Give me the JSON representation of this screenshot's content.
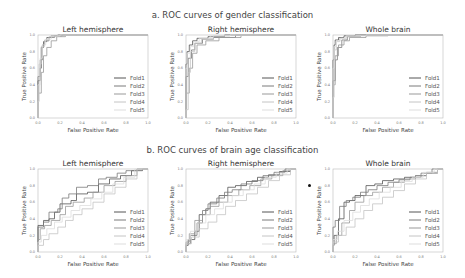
{
  "sections": [
    {
      "title": "a. ROC curves of gender classification"
    },
    {
      "title": "b. ROC curves of brain age classification"
    }
  ],
  "colors": {
    "Fold1": "#555555",
    "Fold2": "#7a7a7a",
    "Fold3": "#999999",
    "Fold4": "#c4c4c4",
    "Fold5": "#dddddd",
    "frame": "#bbbbbb",
    "diagonal": "#cccccc"
  },
  "chart_data": [
    {
      "type": "line",
      "group": "a. ROC curves of gender classification",
      "title": "Left hemisphere",
      "xlabel": "False Positive Rate",
      "ylabel": "True Positive Rate",
      "xlim": [
        0,
        1
      ],
      "ylim": [
        0,
        1
      ],
      "xticks": [
        "0.0",
        "0.2",
        "0.4",
        "0.6",
        "0.8",
        "1.0"
      ],
      "yticks": [
        "0.0",
        "0.2",
        "0.4",
        "0.6",
        "0.8",
        "1.0"
      ],
      "legend": [
        "Fold1",
        "Fold2",
        "Fold3",
        "Fold4",
        "Fold5"
      ],
      "legend_position": "lower right",
      "grid": false,
      "series": [
        {
          "name": "Fold1",
          "x": [
            0,
            0.02,
            0.03,
            0.05,
            0.08,
            0.12,
            0.18,
            0.25,
            0.4,
            1
          ],
          "y": [
            0,
            0.45,
            0.6,
            0.85,
            0.92,
            0.97,
            0.99,
            1,
            1,
            1
          ]
        },
        {
          "name": "Fold2",
          "x": [
            0,
            0.02,
            0.04,
            0.06,
            0.1,
            0.15,
            0.22,
            0.35,
            1
          ],
          "y": [
            0,
            0.5,
            0.7,
            0.88,
            0.93,
            0.97,
            0.99,
            1,
            1
          ]
        },
        {
          "name": "Fold3",
          "x": [
            0,
            0.03,
            0.05,
            0.08,
            0.12,
            0.17,
            0.25,
            0.4,
            1
          ],
          "y": [
            0,
            0.3,
            0.55,
            0.75,
            0.85,
            0.93,
            0.98,
            1,
            1
          ]
        },
        {
          "name": "Fold4",
          "x": [
            0,
            0.01,
            0.03,
            0.06,
            0.1,
            0.18,
            0.3,
            1
          ],
          "y": [
            0,
            0.2,
            0.65,
            0.86,
            0.94,
            0.98,
            1,
            1
          ]
        },
        {
          "name": "Fold5",
          "x": [
            0,
            0.02,
            0.04,
            0.07,
            0.12,
            0.2,
            0.35,
            1
          ],
          "y": [
            0,
            0.4,
            0.72,
            0.88,
            0.95,
            0.99,
            1,
            1
          ]
        }
      ]
    },
    {
      "type": "line",
      "group": "a. ROC curves of gender classification",
      "title": "Right hemisphere",
      "xlabel": "False Positive Rate",
      "ylabel": "True Positive Rate",
      "xlim": [
        0,
        1
      ],
      "ylim": [
        0,
        1
      ],
      "xticks": [
        "0.0",
        "0.2",
        "0.4",
        "0.6",
        "0.8",
        "1.0"
      ],
      "yticks": [
        "0.0",
        "0.2",
        "0.4",
        "0.6",
        "0.8",
        "1.0"
      ],
      "legend": [
        "Fold1",
        "Fold2",
        "Fold3",
        "Fold4",
        "Fold5"
      ],
      "legend_position": "lower right",
      "grid": false,
      "series": [
        {
          "name": "Fold1",
          "x": [
            0,
            0.01,
            0.03,
            0.06,
            0.1,
            0.2,
            0.35,
            0.6,
            1
          ],
          "y": [
            0,
            0.65,
            0.8,
            0.88,
            0.93,
            0.96,
            0.98,
            1,
            1
          ]
        },
        {
          "name": "Fold2",
          "x": [
            0,
            0.02,
            0.05,
            0.08,
            0.15,
            0.25,
            0.45,
            0.7,
            1
          ],
          "y": [
            0,
            0.5,
            0.72,
            0.82,
            0.9,
            0.95,
            0.97,
            1,
            1
          ]
        },
        {
          "name": "Fold3",
          "x": [
            0,
            0.03,
            0.06,
            0.1,
            0.18,
            0.3,
            0.5,
            0.8,
            1
          ],
          "y": [
            0,
            0.3,
            0.6,
            0.78,
            0.88,
            0.93,
            0.97,
            1,
            1
          ]
        },
        {
          "name": "Fold4",
          "x": [
            0,
            0.02,
            0.04,
            0.08,
            0.14,
            0.25,
            0.4,
            1
          ],
          "y": [
            0,
            0.1,
            0.55,
            0.8,
            0.9,
            0.95,
            0.99,
            1
          ]
        },
        {
          "name": "Fold5",
          "x": [
            0,
            0.01,
            0.04,
            0.07,
            0.12,
            0.22,
            0.4,
            1
          ],
          "y": [
            0,
            0.6,
            0.78,
            0.86,
            0.92,
            0.96,
            0.99,
            1
          ]
        }
      ]
    },
    {
      "type": "line",
      "group": "a. ROC curves of gender classification",
      "title": "Whole brain",
      "xlabel": "False Positive Rate",
      "ylabel": "True Positive Rate",
      "xlim": [
        0,
        1
      ],
      "ylim": [
        0,
        1
      ],
      "xticks": [
        "0.0",
        "0.2",
        "0.4",
        "0.6",
        "0.8",
        "1.0"
      ],
      "yticks": [
        "0.0",
        "0.2",
        "0.4",
        "0.6",
        "0.8",
        "1.0"
      ],
      "legend": [
        "Fold1",
        "Fold2",
        "Fold3",
        "Fold4",
        "Fold5"
      ],
      "legend_position": "lower right",
      "grid": false,
      "series": [
        {
          "name": "Fold1",
          "x": [
            0,
            0.01,
            0.02,
            0.05,
            0.1,
            0.2,
            0.4,
            1
          ],
          "y": [
            0,
            0.7,
            0.88,
            0.94,
            0.97,
            0.99,
            1,
            1
          ]
        },
        {
          "name": "Fold2",
          "x": [
            0,
            0.02,
            0.04,
            0.08,
            0.13,
            0.25,
            0.45,
            1
          ],
          "y": [
            0,
            0.45,
            0.7,
            0.85,
            0.94,
            0.98,
            1,
            1
          ]
        },
        {
          "name": "Fold3",
          "x": [
            0,
            0.02,
            0.05,
            0.1,
            0.15,
            0.3,
            0.5,
            1
          ],
          "y": [
            0,
            0.4,
            0.75,
            0.88,
            0.93,
            0.97,
            0.99,
            1
          ]
        },
        {
          "name": "Fold4",
          "x": [
            0,
            0.01,
            0.03,
            0.06,
            0.12,
            0.25,
            0.45,
            1
          ],
          "y": [
            0,
            0.25,
            0.82,
            0.92,
            0.96,
            0.98,
            1,
            1
          ]
        },
        {
          "name": "Fold5",
          "x": [
            0,
            0.01,
            0.03,
            0.07,
            0.12,
            0.3,
            0.6,
            1
          ],
          "y": [
            0,
            0.6,
            0.86,
            0.93,
            0.96,
            0.99,
            1,
            1
          ]
        }
      ]
    },
    {
      "type": "line",
      "group": "b. ROC curves of brain age classification",
      "title": "Left hemisphere",
      "xlabel": "False Positive Rate",
      "ylabel": "True Positive Rate",
      "xlim": [
        0,
        1
      ],
      "ylim": [
        0,
        1
      ],
      "xticks": [
        "0.0",
        "0.2",
        "0.4",
        "0.6",
        "0.8",
        "1.0"
      ],
      "yticks": [
        "0.0",
        "0.2",
        "0.4",
        "0.6",
        "0.8",
        "1.0"
      ],
      "legend": [
        "Fold1",
        "Fold2",
        "Fold3",
        "Fold4",
        "Fold5"
      ],
      "legend_position": "lower right",
      "grid": false,
      "series": [
        {
          "name": "Fold1",
          "x": [
            0,
            0,
            0.05,
            0.1,
            0.15,
            0.2,
            0.3,
            0.35,
            0.45,
            0.55,
            0.65,
            0.75,
            0.85,
            0.95,
            1
          ],
          "y": [
            0,
            0.25,
            0.32,
            0.38,
            0.4,
            0.48,
            0.58,
            0.62,
            0.7,
            0.72,
            0.82,
            0.88,
            0.92,
            0.98,
            1
          ]
        },
        {
          "name": "Fold2",
          "x": [
            0,
            0,
            0.05,
            0.1,
            0.18,
            0.22,
            0.28,
            0.35,
            0.45,
            0.55,
            0.62,
            0.72,
            0.8,
            0.9,
            1
          ],
          "y": [
            0,
            0.28,
            0.3,
            0.36,
            0.48,
            0.52,
            0.65,
            0.7,
            0.78,
            0.8,
            0.88,
            0.9,
            0.95,
            0.98,
            1
          ]
        },
        {
          "name": "Fold3",
          "x": [
            0,
            0.02,
            0.06,
            0.12,
            0.2,
            0.25,
            0.32,
            0.42,
            0.5,
            0.6,
            0.7,
            0.8,
            0.9,
            1
          ],
          "y": [
            0,
            0.15,
            0.28,
            0.32,
            0.38,
            0.45,
            0.55,
            0.6,
            0.65,
            0.72,
            0.8,
            0.85,
            0.92,
            1
          ]
        },
        {
          "name": "Fold4",
          "x": [
            0,
            0.05,
            0.1,
            0.18,
            0.25,
            0.32,
            0.4,
            0.5,
            0.6,
            0.7,
            0.8,
            0.9,
            1
          ],
          "y": [
            0,
            0.08,
            0.15,
            0.22,
            0.3,
            0.38,
            0.45,
            0.52,
            0.6,
            0.7,
            0.78,
            0.88,
            1
          ]
        },
        {
          "name": "Fold5",
          "x": [
            0,
            0.03,
            0.08,
            0.15,
            0.22,
            0.3,
            0.38,
            0.48,
            0.58,
            0.68,
            0.78,
            0.88,
            1
          ],
          "y": [
            0,
            0.12,
            0.2,
            0.28,
            0.36,
            0.42,
            0.5,
            0.56,
            0.64,
            0.72,
            0.82,
            0.9,
            1
          ]
        }
      ]
    },
    {
      "type": "line",
      "group": "b. ROC curves of brain age classification",
      "title": "Right hemisphere",
      "xlabel": "False Positive Rate",
      "ylabel": "True Positive Rate",
      "xlim": [
        0,
        1
      ],
      "ylim": [
        0,
        1
      ],
      "xticks": [
        "0.0",
        "0.2",
        "0.4",
        "0.6",
        "0.8",
        "1.0"
      ],
      "yticks": [
        "0.0",
        "0.2",
        "0.4",
        "0.6",
        "0.8",
        "1.0"
      ],
      "legend": [
        "Fold1",
        "Fold2",
        "Fold3",
        "Fold4",
        "Fold5"
      ],
      "legend_position": "lower right",
      "grid": false,
      "series": [
        {
          "name": "Fold1",
          "x": [
            0,
            0.02,
            0.08,
            0.12,
            0.18,
            0.22,
            0.3,
            0.38,
            0.45,
            0.55,
            0.65,
            0.75,
            0.85,
            0.95,
            1
          ],
          "y": [
            0,
            0.08,
            0.15,
            0.25,
            0.45,
            0.52,
            0.6,
            0.68,
            0.78,
            0.8,
            0.85,
            0.9,
            0.93,
            0.97,
            1
          ]
        },
        {
          "name": "Fold2",
          "x": [
            0,
            0.04,
            0.1,
            0.15,
            0.2,
            0.28,
            0.35,
            0.42,
            0.5,
            0.6,
            0.7,
            0.8,
            0.9,
            1
          ],
          "y": [
            0,
            0.1,
            0.2,
            0.35,
            0.5,
            0.58,
            0.65,
            0.72,
            0.75,
            0.82,
            0.86,
            0.92,
            0.96,
            1
          ]
        },
        {
          "name": "Fold3",
          "x": [
            0,
            0.03,
            0.08,
            0.15,
            0.22,
            0.3,
            0.38,
            0.48,
            0.58,
            0.68,
            0.78,
            0.88,
            0.95,
            1
          ],
          "y": [
            0,
            0.12,
            0.22,
            0.38,
            0.45,
            0.55,
            0.6,
            0.68,
            0.75,
            0.8,
            0.88,
            0.92,
            0.98,
            1
          ]
        },
        {
          "name": "Fold4",
          "x": [
            0,
            0.05,
            0.12,
            0.2,
            0.28,
            0.36,
            0.45,
            0.55,
            0.65,
            0.75,
            0.85,
            0.95,
            1
          ],
          "y": [
            0,
            0.1,
            0.18,
            0.28,
            0.36,
            0.45,
            0.55,
            0.62,
            0.7,
            0.78,
            0.86,
            0.93,
            1
          ]
        },
        {
          "name": "Fold5",
          "x": [
            0,
            0.04,
            0.1,
            0.18,
            0.26,
            0.34,
            0.42,
            0.52,
            0.62,
            0.72,
            0.82,
            0.92,
            1
          ],
          "y": [
            0,
            0.15,
            0.25,
            0.35,
            0.45,
            0.52,
            0.6,
            0.68,
            0.75,
            0.82,
            0.9,
            0.95,
            1
          ]
        }
      ]
    },
    {
      "type": "line",
      "group": "b. ROC curves of brain age classification",
      "title": "Whole brain",
      "xlabel": "False Positive Rate",
      "ylabel": "True Positive Rate",
      "xlim": [
        0,
        1
      ],
      "ylim": [
        0,
        1
      ],
      "xticks": [
        "0.0",
        "0.2",
        "0.4",
        "0.6",
        "0.8",
        "1.0"
      ],
      "yticks": [
        "0.0",
        "0.2",
        "0.4",
        "0.6",
        "0.8",
        "1.0"
      ],
      "legend": [
        "Fold1",
        "Fold2",
        "Fold3",
        "Fold4",
        "Fold5"
      ],
      "legend_position": "lower right",
      "grid": false,
      "series": [
        {
          "name": "Fold1",
          "x": [
            0,
            0.01,
            0.05,
            0.1,
            0.15,
            0.2,
            0.3,
            0.38,
            0.45,
            0.55,
            0.65,
            0.75,
            0.85,
            0.95,
            1
          ],
          "y": [
            0,
            0.08,
            0.2,
            0.4,
            0.6,
            0.62,
            0.68,
            0.8,
            0.82,
            0.86,
            0.88,
            0.9,
            0.92,
            0.95,
            1
          ]
        },
        {
          "name": "Fold2",
          "x": [
            0,
            0.02,
            0.06,
            0.12,
            0.18,
            0.25,
            0.32,
            0.4,
            0.5,
            0.6,
            0.7,
            0.8,
            0.9,
            1
          ],
          "y": [
            0,
            0.3,
            0.38,
            0.55,
            0.62,
            0.66,
            0.72,
            0.75,
            0.8,
            0.84,
            0.87,
            0.9,
            0.95,
            1
          ]
        },
        {
          "name": "Fold3",
          "x": [
            0,
            0.03,
            0.08,
            0.15,
            0.2,
            0.28,
            0.36,
            0.45,
            0.55,
            0.65,
            0.75,
            0.85,
            0.95,
            1
          ],
          "y": [
            0,
            0.1,
            0.2,
            0.35,
            0.5,
            0.6,
            0.68,
            0.72,
            0.78,
            0.84,
            0.88,
            0.92,
            0.96,
            1
          ]
        },
        {
          "name": "Fold4",
          "x": [
            0,
            0.05,
            0.12,
            0.2,
            0.28,
            0.36,
            0.45,
            0.55,
            0.65,
            0.75,
            0.85,
            0.95,
            1
          ],
          "y": [
            0,
            0.12,
            0.2,
            0.3,
            0.4,
            0.5,
            0.58,
            0.66,
            0.74,
            0.82,
            0.88,
            0.95,
            1
          ]
        },
        {
          "name": "Fold5",
          "x": [
            0,
            0.04,
            0.1,
            0.18,
            0.25,
            0.33,
            0.42,
            0.52,
            0.62,
            0.72,
            0.82,
            0.92,
            1
          ],
          "y": [
            0,
            0.15,
            0.25,
            0.38,
            0.48,
            0.56,
            0.64,
            0.72,
            0.78,
            0.85,
            0.9,
            0.96,
            1
          ]
        }
      ]
    }
  ]
}
